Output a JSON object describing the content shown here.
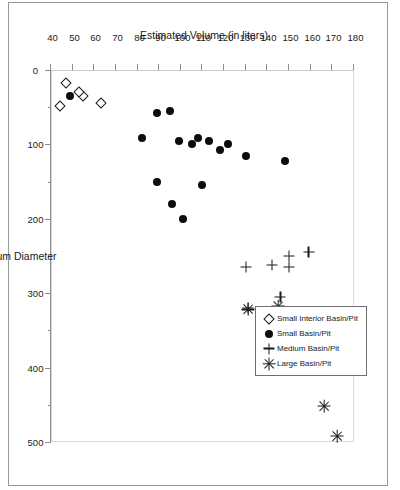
{
  "figure": {
    "rotation_degrees": 90,
    "background": "#ffffff",
    "border_color": "#9a9a9a"
  },
  "legend": {
    "position": "top-right",
    "entries": [
      {
        "label": "Small Interior Basin/Pit",
        "marker": "diamond-open-icon",
        "key": "small_interior"
      },
      {
        "label": "Small Basin/Pit",
        "marker": "filled-circle-icon",
        "key": "small"
      },
      {
        "label": "Medium Basin/Pit",
        "marker": "plus-icon",
        "key": "medium"
      },
      {
        "label": "Large Basin/Pit",
        "marker": "asterisk-icon",
        "key": "large"
      }
    ]
  },
  "chart_data": {
    "type": "scatter",
    "title": "",
    "xlabel": "Maximum Diameter",
    "ylabel": "Estimated Volume (in liters)",
    "xlim": [
      40,
      180
    ],
    "ylim": [
      0,
      500
    ],
    "xticks": [
      40,
      50,
      60,
      70,
      80,
      90,
      100,
      110,
      120,
      130,
      140,
      150,
      160,
      170,
      180
    ],
    "xtick_labels": [
      "40",
      "50",
      "60",
      "70",
      "80",
      "90",
      "100",
      "110",
      "120",
      "130",
      "140",
      "150",
      "160",
      "170",
      "180"
    ],
    "yticks": [
      0,
      100,
      200,
      300,
      400,
      500
    ],
    "ytick_labels": [
      "0",
      "100",
      "200",
      "300",
      "400",
      "500"
    ],
    "yminor_ticks": [
      50,
      150,
      250,
      350,
      450
    ],
    "grid": false,
    "legend_position": "top-right",
    "series": [
      {
        "name": "Small Interior Basin/Pit",
        "marker": "diamond-open-icon",
        "points": [
          {
            "x": 63,
            "y": 45
          },
          {
            "x": 55,
            "y": 35
          },
          {
            "x": 53,
            "y": 30
          },
          {
            "x": 47,
            "y": 18
          },
          {
            "x": 44,
            "y": 48
          }
        ]
      },
      {
        "name": "Small Basin/Pit",
        "marker": "filled-circle-icon",
        "points": [
          {
            "x": 148,
            "y": 122
          },
          {
            "x": 130,
            "y": 115
          },
          {
            "x": 122,
            "y": 100
          },
          {
            "x": 118,
            "y": 108
          },
          {
            "x": 113,
            "y": 95
          },
          {
            "x": 110,
            "y": 155
          },
          {
            "x": 108,
            "y": 92
          },
          {
            "x": 105,
            "y": 100
          },
          {
            "x": 101,
            "y": 200
          },
          {
            "x": 99,
            "y": 95
          },
          {
            "x": 96,
            "y": 180
          },
          {
            "x": 95,
            "y": 55
          },
          {
            "x": 89,
            "y": 150
          },
          {
            "x": 89,
            "y": 58
          },
          {
            "x": 82,
            "y": 92
          },
          {
            "x": 49,
            "y": 35
          }
        ]
      },
      {
        "name": "Medium Basin/Pit",
        "marker": "plus-icon",
        "points": [
          {
            "x": 159,
            "y": 245
          },
          {
            "x": 150,
            "y": 265
          },
          {
            "x": 150,
            "y": 250
          },
          {
            "x": 146,
            "y": 305
          },
          {
            "x": 142,
            "y": 262
          },
          {
            "x": 131,
            "y": 320
          },
          {
            "x": 130,
            "y": 265
          }
        ]
      },
      {
        "name": "Large Basin/Pit",
        "marker": "asterisk-icon",
        "points": [
          {
            "x": 172,
            "y": 492
          },
          {
            "x": 166,
            "y": 452
          },
          {
            "x": 145,
            "y": 318
          },
          {
            "x": 131,
            "y": 322
          }
        ]
      }
    ]
  }
}
